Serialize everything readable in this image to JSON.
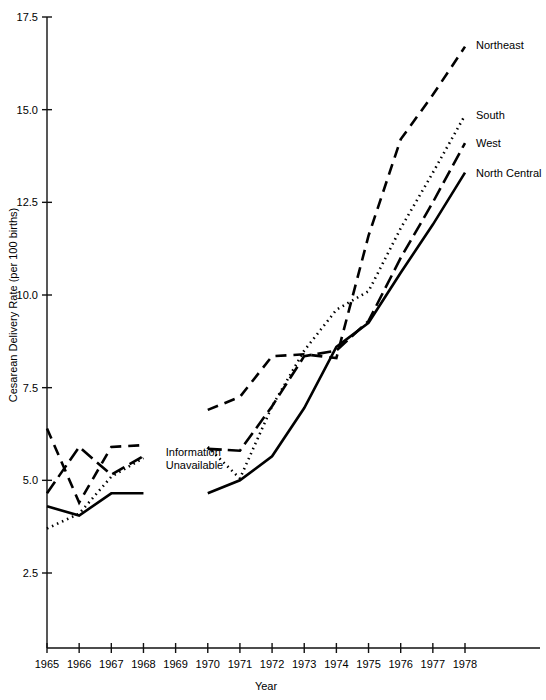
{
  "chart_data": {
    "type": "line",
    "title": "",
    "xlabel": "Year",
    "ylabel": "Cesarean Delivery Rate (per 100 births)",
    "xlim": [
      1965,
      1978
    ],
    "ylim": [
      2.5,
      17.5
    ],
    "grid": false,
    "legend_position": "right-inline",
    "x_tick_labels": [
      "1965",
      "1966",
      "1967",
      "1968",
      "1969",
      "1970",
      "1971",
      "1972",
      "1973",
      "1974",
      "1975",
      "1976",
      "1977",
      "1978"
    ],
    "y_tick_labels": [
      "2.5",
      "5.0",
      "7.5",
      "10.0",
      "12.5",
      "15.0",
      "17.5"
    ],
    "x_ticks": [
      1965,
      1966,
      1967,
      1968,
      1969,
      1970,
      1971,
      1972,
      1973,
      1974,
      1975,
      1976,
      1977,
      1978
    ],
    "y_ticks": [
      2.5,
      5.0,
      7.5,
      10.0,
      12.5,
      15.0,
      17.5
    ],
    "annotations": [
      {
        "name": "information-unavailable-note",
        "text_line_1": "Information",
        "text_line_2": "Unavailable",
        "x": 1968.6,
        "y": 5.7
      }
    ],
    "series": [
      {
        "name": "Northeast",
        "label": "Northeast",
        "dash_style": "dashed",
        "dasharray": "11,7",
        "label_x": 1978.25,
        "label_y": 16.75,
        "segments": [
          {
            "x": [
              1965,
              1966,
              1967,
              1968
            ],
            "values": [
              6.4,
              4.4,
              5.9,
              5.95
            ]
          },
          {
            "x": [
              1970,
              1971,
              1972,
              1973,
              1974,
              1975,
              1976,
              1977,
              1978
            ],
            "values": [
              6.9,
              7.25,
              8.35,
              8.4,
              8.3,
              11.6,
              14.2,
              15.4,
              16.7
            ]
          }
        ]
      },
      {
        "name": "South",
        "label": "South",
        "dash_style": "dotted",
        "dasharray": "1.5,4",
        "label_x": 1978.25,
        "label_y": 14.85,
        "segments": [
          {
            "x": [
              1965,
              1966,
              1967,
              1968
            ],
            "values": [
              3.7,
              4.1,
              5.1,
              5.6
            ]
          },
          {
            "x": [
              1970,
              1971,
              1972,
              1973,
              1974,
              1975,
              1976,
              1977,
              1978
            ],
            "values": [
              5.9,
              5.05,
              7.0,
              8.5,
              9.6,
              10.1,
              11.8,
              13.3,
              14.85
            ]
          }
        ]
      },
      {
        "name": "West",
        "label": "West",
        "dash_style": "long-dash",
        "dasharray": "14,6",
        "label_x": 1978.25,
        "label_y": 14.1,
        "segments": [
          {
            "x": [
              1965,
              1966,
              1967,
              1968
            ],
            "values": [
              4.65,
              5.9,
              5.15,
              5.65
            ]
          },
          {
            "x": [
              1970,
              1971,
              1972,
              1973,
              1974,
              1975,
              1976,
              1977,
              1978
            ],
            "values": [
              5.85,
              5.8,
              7.0,
              8.35,
              8.5,
              9.3,
              11.0,
              12.5,
              14.1
            ]
          }
        ]
      },
      {
        "name": "North Central",
        "label": "North Central",
        "dash_style": "solid",
        "dasharray": "none",
        "label_x": 1978.25,
        "label_y": 13.3,
        "segments": [
          {
            "x": [
              1965,
              1966,
              1967,
              1968
            ],
            "values": [
              4.3,
              4.05,
              4.65,
              4.65
            ]
          },
          {
            "x": [
              1970,
              1971,
              1972,
              1973,
              1974,
              1975,
              1976,
              1977,
              1978
            ],
            "values": [
              4.65,
              5.0,
              5.65,
              6.95,
              8.6,
              9.25,
              10.6,
              11.9,
              13.3
            ]
          }
        ]
      }
    ]
  }
}
